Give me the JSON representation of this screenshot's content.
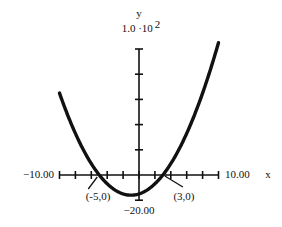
{
  "chart_data": {
    "type": "line",
    "title": "",
    "function": "y = (x + 5)(x - 3)",
    "xlabel": "x",
    "ylabel": "y",
    "xlim": [
      -10,
      10
    ],
    "ylim": [
      -20,
      100
    ],
    "x_tick_step": 2,
    "y_tick_step": 20,
    "y_scale_label": "1.0 ·10 2",
    "x_min_label": "−10.00",
    "x_max_label": "10.00",
    "y_min_label": "−20.00",
    "grid": false,
    "series": [
      {
        "name": "parabola",
        "x": [
          -10,
          -8,
          -6,
          -5,
          -4,
          -2,
          -1,
          0,
          2,
          3,
          4,
          6,
          8,
          10
        ],
        "values": [
          65,
          33,
          9,
          0,
          -7,
          -15,
          -16,
          -15,
          -7,
          0,
          9,
          33,
          65,
          105
        ]
      }
    ],
    "annotations": [
      {
        "label": "(-5,0)",
        "x": -5,
        "y": 0
      },
      {
        "label": "(3,0)",
        "x": 3,
        "y": 0
      }
    ]
  }
}
